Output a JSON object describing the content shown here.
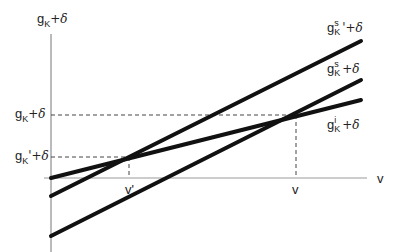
{
  "diagram": {
    "y_axis_label": {
      "g": "g",
      "sub": "K",
      "rest": "+δ"
    },
    "x_axis_label": "v",
    "lines": [
      {
        "id": "gKs_prime",
        "label": {
          "g": "g",
          "sup": "s",
          "sub": "K",
          "rest": "'+δ"
        },
        "from": [
          51,
          196
        ],
        "to": [
          361,
          41
        ]
      },
      {
        "id": "gKs",
        "label": {
          "g": "g",
          "sup": "s",
          "sub": "K",
          "rest": "+δ"
        },
        "from": [
          51,
          236
        ],
        "to": [
          361,
          80
        ]
      },
      {
        "id": "gKi",
        "label": {
          "g": "g",
          "sup": "i",
          "sub": "K",
          "rest": "+δ"
        },
        "from": [
          51,
          178
        ],
        "to": [
          361,
          100
        ]
      }
    ],
    "y_ticks": [
      {
        "label": {
          "g": "g",
          "sub": "K",
          "rest": "+δ"
        },
        "y": 115
      },
      {
        "label": {
          "g": "g",
          "sub": "K",
          "rest": "'+δ"
        },
        "y": 157
      }
    ],
    "x_ticks": [
      {
        "label": "v'",
        "x": 129
      },
      {
        "label": "v",
        "x": 296
      }
    ],
    "colors": {
      "line": "#111111",
      "axis": "#888888",
      "dash": "#444444"
    }
  }
}
